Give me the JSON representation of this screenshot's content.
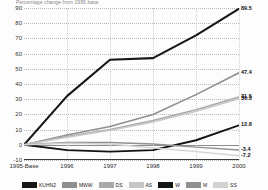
{
  "chart_data": {
    "type": "line",
    "title": "Percentage change from 1995 base",
    "xlabel": "",
    "ylabel": "",
    "categories": [
      "1995-Base",
      "1996",
      "1997",
      "1998",
      "1999",
      "2000"
    ],
    "ylim": [
      -10,
      90
    ],
    "yticks": [
      -10,
      0,
      10,
      20,
      30,
      40,
      50,
      60,
      70,
      80,
      90
    ],
    "grid": true,
    "legend_position": "bottom",
    "series": [
      {
        "name": "KUHN2",
        "color": "#171717",
        "width": 2.1,
        "values": [
          0,
          32,
          56,
          57,
          72,
          89.5
        ],
        "end_label": "89.5"
      },
      {
        "name": "MWW",
        "color": "#8f8f8f",
        "width": 1.6,
        "values": [
          0,
          6.5,
          12,
          20,
          33,
          47.4
        ],
        "end_label": "47.4"
      },
      {
        "name": "DS",
        "color": "#a9a9a9",
        "width": 1.5,
        "values": [
          0,
          5.5,
          10,
          16,
          23,
          31.5
        ],
        "end_label": "31.5"
      },
      {
        "name": "AS",
        "color": "#c6c6c6",
        "width": 1.5,
        "values": [
          0,
          5,
          9.5,
          15,
          22,
          30.3
        ],
        "end_label": "30.3"
      },
      {
        "name": "W",
        "color": "#131313",
        "width": 1.9,
        "values": [
          0,
          -3.5,
          -4.5,
          -3.5,
          3,
          12.8
        ],
        "end_label": "12.8"
      },
      {
        "name": "M",
        "color": "#909090",
        "width": 1.4,
        "values": [
          0,
          1.5,
          1.5,
          0.5,
          -1.5,
          -3.4
        ],
        "end_label": "-3.4"
      },
      {
        "name": "SS",
        "color": "#d2d2d2",
        "width": 1.4,
        "values": [
          0,
          1,
          0.5,
          -2,
          -4.5,
          -7.2
        ],
        "end_label": "-7.2"
      }
    ]
  }
}
